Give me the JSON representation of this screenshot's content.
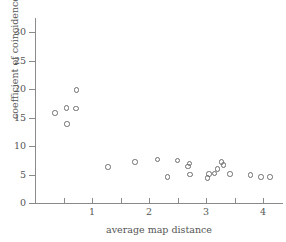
{
  "chart_data": {
    "type": "scatter",
    "title": "",
    "xlabel": "average map distance",
    "ylabel": "coefficient of coincidence",
    "xlim": [
      0,
      4.35
    ],
    "ylim": [
      0,
      32
    ],
    "xticks": [
      1,
      2,
      3,
      4
    ],
    "xticks_minor": [
      0.5,
      1.5,
      2.5,
      3.5
    ],
    "yticks": [
      0,
      5,
      10,
      15,
      20,
      25,
      30
    ],
    "grid": false,
    "legend": null,
    "marker": "open-circle",
    "marker_color": "#6e6e6e",
    "points": [
      {
        "x": 0.35,
        "y": 15.8
      },
      {
        "x": 0.55,
        "y": 16.7
      },
      {
        "x": 0.56,
        "y": 13.9
      },
      {
        "x": 0.72,
        "y": 16.6
      },
      {
        "x": 0.73,
        "y": 19.8
      },
      {
        "x": 1.28,
        "y": 6.3
      },
      {
        "x": 1.75,
        "y": 7.2
      },
      {
        "x": 2.15,
        "y": 7.6
      },
      {
        "x": 2.32,
        "y": 4.6
      },
      {
        "x": 2.5,
        "y": 7.5
      },
      {
        "x": 2.68,
        "y": 6.4
      },
      {
        "x": 2.71,
        "y": 6.9
      },
      {
        "x": 2.72,
        "y": 5.0
      },
      {
        "x": 3.03,
        "y": 4.4
      },
      {
        "x": 3.05,
        "y": 5.1
      },
      {
        "x": 3.15,
        "y": 5.2
      },
      {
        "x": 3.2,
        "y": 6.0
      },
      {
        "x": 3.27,
        "y": 7.2
      },
      {
        "x": 3.31,
        "y": 6.7
      },
      {
        "x": 3.42,
        "y": 5.1
      },
      {
        "x": 3.78,
        "y": 4.9
      },
      {
        "x": 3.96,
        "y": 4.6
      },
      {
        "x": 4.12,
        "y": 4.6
      }
    ]
  }
}
